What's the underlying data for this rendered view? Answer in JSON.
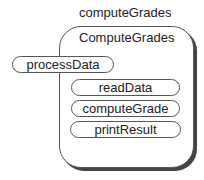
{
  "diagram": {
    "module_label": "computeGrades",
    "class_label": "ComputeGrades",
    "external_method": "processData",
    "methods": [
      "readData",
      "computeGrade",
      "printResult"
    ]
  }
}
